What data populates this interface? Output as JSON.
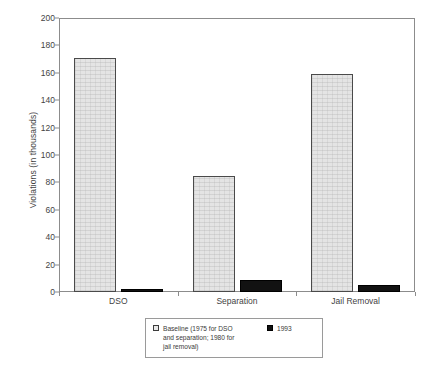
{
  "chart_data": {
    "type": "bar",
    "title": "",
    "xlabel": "",
    "ylabel": "Violations (in thousands)",
    "categories": [
      "DSO",
      "Separation",
      "Jail Removal"
    ],
    "series": [
      {
        "name": "Baseline (1975 for DSO\nand separation; 1980 for\njail removal)",
        "legend_label": "Baseline (1975 for DSO\nand separation; 1980 for\njail removal)",
        "color": "#e4e4e4",
        "edge_color": "#4a4a4a",
        "values": [
          171,
          84.5,
          159
        ]
      },
      {
        "name": "1993",
        "legend_label": "1993",
        "color": "#121212",
        "edge_color": "#000000",
        "values": [
          2.5,
          8.5,
          5
        ]
      }
    ],
    "ylim": [
      0,
      200
    ],
    "ytick_labels": [
      "0",
      "20",
      "40",
      "60",
      "80",
      "100",
      "120",
      "140",
      "160",
      "180",
      "200"
    ],
    "ytick_values": [
      0,
      20,
      40,
      60,
      80,
      100,
      120,
      140,
      160,
      180,
      200
    ],
    "grid": false,
    "legend_position": "below-plot-center",
    "frame_color": "#8c8c8c"
  },
  "axis": {
    "y_title": "Violations (in thousands)"
  },
  "legend": {
    "baseline_label": "Baseline (1975 for DSO\nand separation; 1980 for\njail removal)",
    "series_1993_label": "1993"
  },
  "xaxis": {
    "cat_0": "DSO",
    "cat_1": "Separation",
    "cat_2": "Jail Removal"
  },
  "yaxis": {
    "t0": "0",
    "t1": "20",
    "t2": "40",
    "t3": "60",
    "t4": "80",
    "t5": "100",
    "t6": "120",
    "t7": "140",
    "t8": "160",
    "t9": "180",
    "t10": "200"
  }
}
